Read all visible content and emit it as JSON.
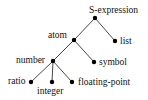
{
  "diagram": {
    "type": "tree",
    "nodes": [
      {
        "id": "sexpr",
        "label": "S-expression",
        "x": 95,
        "y": 18
      },
      {
        "id": "atom",
        "label": "atom",
        "x": 74,
        "y": 40
      },
      {
        "id": "list",
        "label": "list",
        "x": 115,
        "y": 41
      },
      {
        "id": "number",
        "label": "number",
        "x": 53,
        "y": 61
      },
      {
        "id": "symbol",
        "label": "symbol",
        "x": 94,
        "y": 62
      },
      {
        "id": "ratio",
        "label": "ratio",
        "x": 31,
        "y": 82
      },
      {
        "id": "integer",
        "label": "integer",
        "x": 52,
        "y": 82
      },
      {
        "id": "floating",
        "label": "floating-point",
        "x": 72,
        "y": 82
      }
    ],
    "edges": [
      [
        "sexpr",
        "atom"
      ],
      [
        "sexpr",
        "list"
      ],
      [
        "atom",
        "number"
      ],
      [
        "atom",
        "symbol"
      ],
      [
        "number",
        "ratio"
      ],
      [
        "number",
        "integer"
      ],
      [
        "number",
        "floating"
      ]
    ]
  },
  "labels": {
    "sexpr": "S-expression",
    "atom": "atom",
    "list": "list",
    "number": "number",
    "symbol": "symbol",
    "ratio": "ratio",
    "integer": "integer",
    "floating": "floating-point"
  }
}
